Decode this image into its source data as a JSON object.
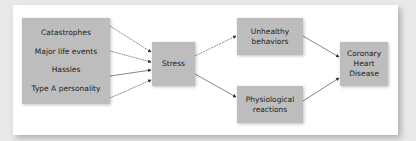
{
  "diagram": {
    "causes": [
      "Catastrophes",
      "Major life events",
      "Hassles",
      "Type A personality"
    ],
    "mediator": "Stress",
    "pathways": {
      "upper": [
        "Unhealthy",
        "behaviors"
      ],
      "lower": [
        "Physiological",
        "reactions"
      ]
    },
    "outcome": [
      "Coronary",
      "Heart",
      "Disease"
    ],
    "colors": {
      "box": "#bdbdbd",
      "panel": "#ffffff",
      "background": "#e9e9e9",
      "arrow": "#333333"
    }
  }
}
